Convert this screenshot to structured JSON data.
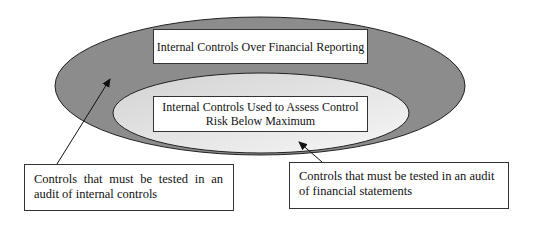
{
  "diagram": {
    "outer_region": {
      "label": "Internal Controls Over Financial Reporting",
      "fill": "#8c8c8c"
    },
    "inner_region": {
      "label": "Internal Controls Used to Assess Control Risk Below Maximum",
      "fill_start": "#d4d4d4",
      "fill_end": "#f4f4f4"
    },
    "callouts": [
      {
        "text": "Controls that must be tested in an audit of internal controls",
        "points_to": "outer_region"
      },
      {
        "text": "Controls that must be tested in an audit of financial statements",
        "points_to": "inner_region"
      }
    ]
  }
}
